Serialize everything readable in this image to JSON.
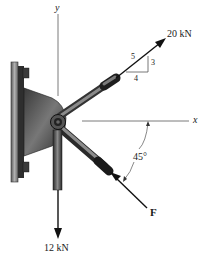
{
  "figure": {
    "axes": {
      "x_label": "x",
      "y_label": "y"
    },
    "forces": [
      {
        "name": "top-force",
        "label": "20 kN",
        "slope": {
          "hyp": "5",
          "rise": "3",
          "run": "4"
        }
      },
      {
        "name": "bottom-force",
        "label": "12 kN",
        "direction": "down"
      },
      {
        "name": "force-f",
        "label": "F",
        "angle_label": "45°"
      }
    ],
    "caption": ""
  },
  "colors": {
    "ink": "#1a1a1a",
    "axis": "#7a7a7a",
    "metal_dark": "#2b2b2b",
    "metal_mid": "#6a6a6a",
    "metal_light": "#a8a8a8",
    "wall": "#8c8c8c"
  }
}
